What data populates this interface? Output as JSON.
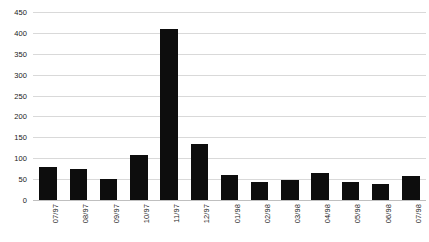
{
  "chart_data": {
    "type": "bar",
    "title": "",
    "subtitle": "",
    "xlabel": "",
    "ylabel": "",
    "categories": [
      "07/97",
      "08/97",
      "09/97",
      "10/97",
      "11/97",
      "12/97",
      "01/98",
      "02/98",
      "03/98",
      "04/98",
      "05/98",
      "06/98",
      "07/98"
    ],
    "values": [
      80,
      75,
      50,
      108,
      410,
      133,
      60,
      43,
      48,
      65,
      43,
      38,
      57
    ],
    "ylim": [
      0,
      450
    ],
    "ytick_step": 50,
    "yticks": [
      450,
      400,
      350,
      300,
      250,
      200,
      150,
      100,
      50,
      0
    ],
    "ytick_labels": [
      "450",
      "400",
      "350",
      "300",
      "250",
      "200",
      "150",
      "100",
      "50",
      "0"
    ],
    "grid": true,
    "grid_axis": "y",
    "legend": false,
    "legend_position": "none",
    "series": [
      {
        "name": "Series 1",
        "values": [
          80,
          75,
          50,
          108,
          410,
          133,
          60,
          43,
          48,
          65,
          43,
          38,
          57
        ]
      }
    ],
    "bar_color": "#0d0d0d",
    "grid_color": "#d9d9d9",
    "background_color": "#ffffff",
    "xtick_rotation": -90
  }
}
